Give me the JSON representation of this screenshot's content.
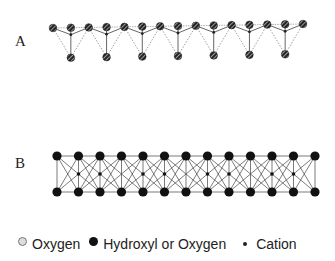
{
  "panels": {
    "a": {
      "label": "A",
      "description": "tetrahedral sheet"
    },
    "b": {
      "label": "B",
      "description": "octahedral sheet"
    }
  },
  "legend": [
    {
      "symbol": "hatched-circle",
      "label": "Oxygen"
    },
    {
      "symbol": "filled-circle",
      "label": "Hydroxyl or Oxygen"
    },
    {
      "symbol": "small-dot",
      "label": "Cation"
    }
  ],
  "colors": {
    "atom": "#111111",
    "line": "#555555",
    "dashed": "#888888"
  },
  "geometry": {
    "a": {
      "top_count": 15,
      "top_x0": 53,
      "top_x1": 303,
      "top_y0": 28,
      "top_y1": 24,
      "bottom_count": 7
    },
    "b": {
      "count": 13,
      "x0": 57,
      "x1": 315,
      "top_y": 156,
      "bottom_y": 192
    }
  }
}
